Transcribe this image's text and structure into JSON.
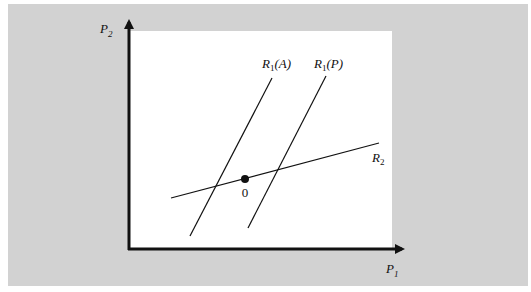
{
  "figure": {
    "background_color": "#d2d2d2",
    "plot_color": "#ffffff",
    "line_color": "#111111"
  },
  "axes": {
    "x_label": {
      "base": "P",
      "sub": "1"
    },
    "y_label": {
      "base": "P",
      "sub": "2"
    }
  },
  "curves": [
    {
      "id": "R1A",
      "label_base": "R",
      "label_sub": "1",
      "label_arg": "(A)",
      "x1": 190,
      "y1": 236,
      "x2": 272,
      "y2": 78
    },
    {
      "id": "R1P",
      "label_base": "R",
      "label_sub": "1",
      "label_arg": "(P)",
      "x1": 248,
      "y1": 228,
      "x2": 326,
      "y2": 76
    },
    {
      "id": "R2",
      "label_base": "R",
      "label_sub": "2",
      "label_arg": "",
      "x1": 171,
      "y1": 198,
      "x2": 379,
      "y2": 143
    }
  ],
  "point": {
    "label": "0",
    "cx": 245,
    "cy": 179
  }
}
